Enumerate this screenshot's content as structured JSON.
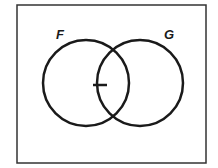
{
  "diagram": {
    "type": "venn",
    "frame": {
      "x": 17,
      "y": 5,
      "width": 189,
      "height": 158,
      "stroke": "#333333"
    },
    "sets": [
      {
        "label": "F",
        "cx": 86,
        "cy": 83,
        "r": 43,
        "label_x": 56,
        "label_y": 39
      },
      {
        "label": "G",
        "cx": 140,
        "cy": 83,
        "r": 43,
        "label_x": 164,
        "label_y": 39
      }
    ],
    "marker": {
      "shape": "dash",
      "x1": 93,
      "y1": 85,
      "x2": 107,
      "y2": 85
    },
    "stroke_color": "#1a1a1a"
  }
}
